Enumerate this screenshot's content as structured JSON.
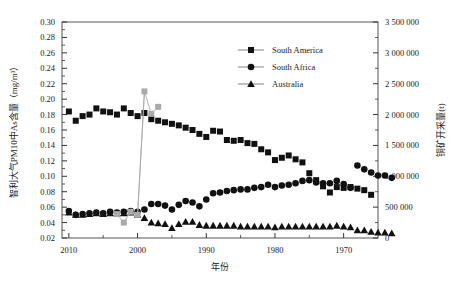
{
  "chart_data": {
    "type": "scatter",
    "title": "",
    "xlabel": "年份",
    "ylabel": "智利大气PM10中As含量（mg/m³）",
    "y2label": "铜矿开采量(t)",
    "x_axis": {
      "ticks": [
        "2010",
        "2000",
        "1990",
        "1980",
        "1970"
      ],
      "tick_values": [
        2010,
        2000,
        1990,
        1980,
        1970
      ],
      "reversed": true,
      "min": 2011,
      "max": 1965,
      "minor_ticks": true
    },
    "y_axis": {
      "ticks": [
        "0.30",
        "0.28",
        "0.26",
        "0.24",
        "0.22",
        "0.20",
        "0.18",
        "0.16",
        "0.14",
        "0.12",
        "0.10",
        "0.08",
        "0.06",
        "0.04",
        "0.02"
      ],
      "tick_values": [
        0.3,
        0.28,
        0.26,
        0.24,
        0.22,
        0.2,
        0.18,
        0.16,
        0.14,
        0.12,
        0.1,
        0.08,
        0.06,
        0.04,
        0.02
      ],
      "min": 0.02,
      "max": 0.3,
      "minor_ticks": true
    },
    "y2_axis": {
      "ticks": [
        "3 500 000",
        "3 000 000",
        "2 500 000",
        "2 000 000",
        "1 500 000",
        "1 000 000",
        "500 000",
        "0"
      ],
      "tick_values": [
        3500000,
        3000000,
        2500000,
        2000000,
        1500000,
        1000000,
        500000,
        0
      ],
      "min": 0,
      "max": 3500000,
      "minor_ticks": true
    },
    "grid": false,
    "legend_position": "top-right",
    "series": [
      {
        "name": "South America",
        "marker": "square",
        "color": "#111111",
        "axis": "left",
        "points": [
          [
            2010,
            0.184
          ],
          [
            2009,
            0.172
          ],
          [
            2008,
            0.178
          ],
          [
            2007,
            0.18
          ],
          [
            2006,
            0.188
          ],
          [
            2005,
            0.184
          ],
          [
            2004,
            0.183
          ],
          [
            2003,
            0.18
          ],
          [
            2002,
            0.188
          ],
          [
            2001,
            0.182
          ],
          [
            2000,
            0.178
          ],
          [
            1999,
            0.182
          ],
          [
            1998,
            0.174
          ],
          [
            1997,
            0.172
          ],
          [
            1996,
            0.17
          ],
          [
            1995,
            0.168
          ],
          [
            1994,
            0.166
          ],
          [
            1993,
            0.163
          ],
          [
            1992,
            0.16
          ],
          [
            1991,
            0.155
          ],
          [
            1990,
            0.151
          ],
          [
            1989,
            0.159
          ],
          [
            1988,
            0.158
          ],
          [
            1987,
            0.147
          ],
          [
            1986,
            0.146
          ],
          [
            1985,
            0.147
          ],
          [
            1984,
            0.143
          ],
          [
            1983,
            0.142
          ],
          [
            1982,
            0.135
          ],
          [
            1981,
            0.131
          ],
          [
            1980,
            0.121
          ],
          [
            1979,
            0.124
          ],
          [
            1978,
            0.127
          ],
          [
            1977,
            0.122
          ],
          [
            1976,
            0.118
          ],
          [
            1975,
            0.104
          ],
          [
            1974,
            0.095
          ],
          [
            1973,
            0.087
          ],
          [
            1972,
            0.079
          ],
          [
            1971,
            0.086
          ],
          [
            1970,
            0.085
          ],
          [
            1969,
            0.086
          ],
          [
            1968,
            0.084
          ],
          [
            1967,
            0.082
          ],
          [
            1966,
            0.076
          ]
        ]
      },
      {
        "name": "South Africa",
        "marker": "circle",
        "color": "#111111",
        "axis": "left",
        "points": [
          [
            2010,
            0.055
          ],
          [
            2009,
            0.05
          ],
          [
            2008,
            0.051
          ],
          [
            2007,
            0.052
          ],
          [
            2006,
            0.053
          ],
          [
            2005,
            0.052
          ],
          [
            2004,
            0.054
          ],
          [
            2003,
            0.053
          ],
          [
            2002,
            0.054
          ],
          [
            2001,
            0.055
          ],
          [
            2000,
            0.054
          ],
          [
            1999,
            0.057
          ],
          [
            1998,
            0.064
          ],
          [
            1997,
            0.064
          ],
          [
            1996,
            0.062
          ],
          [
            1995,
            0.057
          ],
          [
            1994,
            0.063
          ],
          [
            1993,
            0.068
          ],
          [
            1992,
            0.066
          ],
          [
            1991,
            0.061
          ],
          [
            1990,
            0.07
          ],
          [
            1989,
            0.078
          ],
          [
            1988,
            0.079
          ],
          [
            1987,
            0.081
          ],
          [
            1986,
            0.082
          ],
          [
            1985,
            0.083
          ],
          [
            1984,
            0.083
          ],
          [
            1983,
            0.085
          ],
          [
            1982,
            0.086
          ],
          [
            1981,
            0.089
          ],
          [
            1980,
            0.086
          ],
          [
            1979,
            0.088
          ],
          [
            1978,
            0.089
          ],
          [
            1977,
            0.091
          ],
          [
            1976,
            0.094
          ],
          [
            1975,
            0.095
          ],
          [
            1974,
            0.092
          ],
          [
            1973,
            0.091
          ],
          [
            1972,
            0.091
          ],
          [
            1971,
            0.094
          ],
          [
            1970,
            0.09
          ],
          [
            1969,
            0.085
          ],
          [
            1968,
            0.114
          ],
          [
            1967,
            0.109
          ],
          [
            1966,
            0.105
          ],
          [
            1965,
            0.101
          ],
          [
            1964,
            0.101
          ],
          [
            1963,
            0.098
          ]
        ]
      },
      {
        "name": "Australia",
        "marker": "triangle",
        "color": "#111111",
        "axis": "left",
        "points": [
          [
            2010,
            0.053
          ],
          [
            2009,
            0.05
          ],
          [
            2008,
            0.05
          ],
          [
            2007,
            0.051
          ],
          [
            2006,
            0.052
          ],
          [
            2005,
            0.051
          ],
          [
            2004,
            0.052
          ],
          [
            2003,
            0.052
          ],
          [
            2002,
            0.052
          ],
          [
            2001,
            0.053
          ],
          [
            2000,
            0.05
          ],
          [
            1999,
            0.046
          ],
          [
            1998,
            0.04
          ],
          [
            1997,
            0.039
          ],
          [
            1996,
            0.038
          ],
          [
            1995,
            0.033
          ],
          [
            1994,
            0.038
          ],
          [
            1993,
            0.041
          ],
          [
            1992,
            0.041
          ],
          [
            1991,
            0.037
          ],
          [
            1990,
            0.036
          ],
          [
            1989,
            0.036
          ],
          [
            1988,
            0.036
          ],
          [
            1987,
            0.036
          ],
          [
            1986,
            0.036
          ],
          [
            1985,
            0.035
          ],
          [
            1984,
            0.035
          ],
          [
            1983,
            0.035
          ],
          [
            1982,
            0.035
          ],
          [
            1981,
            0.035
          ],
          [
            1980,
            0.034
          ],
          [
            1979,
            0.035
          ],
          [
            1978,
            0.035
          ],
          [
            1977,
            0.035
          ],
          [
            1976,
            0.035
          ],
          [
            1975,
            0.035
          ],
          [
            1974,
            0.035
          ],
          [
            1973,
            0.035
          ],
          [
            1972,
            0.035
          ],
          [
            1971,
            0.036
          ],
          [
            1970,
            0.035
          ],
          [
            1969,
            0.034
          ],
          [
            1968,
            0.03
          ],
          [
            1967,
            0.03
          ],
          [
            1966,
            0.028
          ],
          [
            1965,
            0.027
          ],
          [
            1964,
            0.027
          ],
          [
            1963,
            0.026
          ]
        ]
      },
      {
        "name": "copper-production",
        "marker": "square",
        "color": "#aaaaaa",
        "axis": "right",
        "line": true,
        "points": [
          [
            2003,
            0.051
          ],
          [
            2002,
            0.04
          ],
          [
            2001,
            0.054
          ],
          [
            2000,
            0.05
          ],
          [
            1999,
            0.21
          ],
          [
            1998,
            0.181
          ],
          [
            1997,
            0.19
          ]
        ]
      }
    ],
    "legend": [
      {
        "label": "South America",
        "marker": "square"
      },
      {
        "label": "South Africa",
        "marker": "circle"
      },
      {
        "label": "Australia",
        "marker": "triangle"
      }
    ]
  }
}
